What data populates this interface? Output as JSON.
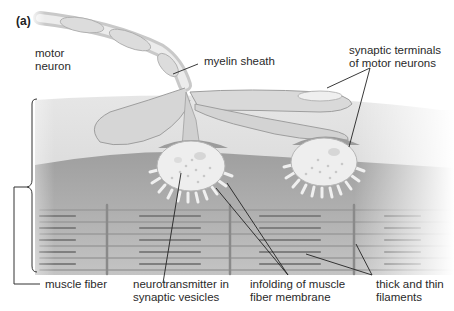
{
  "figure": {
    "panel_label": "(a)"
  },
  "labels": {
    "motor_neuron": "motor\nneuron",
    "myelin_sheath": "myelin sheath",
    "synaptic_terminals": "synaptic terminals\nof motor neurons",
    "muscle_fiber": "muscle fiber",
    "neurotransmitter": "neurotransmitter in\nsynaptic vesicles",
    "infolding": "infolding of muscle\nfiber membrane",
    "filaments": "thick and thin\nfilaments"
  },
  "colors": {
    "background": "#ffffff",
    "muscle_surface": "#d9d9d9",
    "muscle_interior": "#a9a9a9",
    "axon": "#d4d4d4",
    "terminal": "#ececec",
    "leader_line": "#222222"
  }
}
